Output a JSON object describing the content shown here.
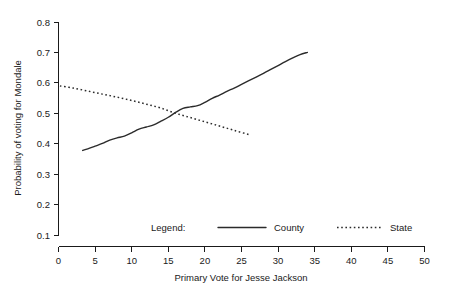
{
  "chart_data": {
    "type": "line",
    "title": "",
    "xlabel": "Primary Vote for Jesse Jackson",
    "ylabel": "Probability of voting for Mondale",
    "xlim": [
      0,
      50
    ],
    "ylim": [
      0.1,
      0.8
    ],
    "xticks": [
      0,
      5,
      10,
      15,
      20,
      25,
      30,
      35,
      40,
      45,
      50
    ],
    "xtick_labels": [
      "0",
      "5",
      "10",
      "15",
      "20",
      "25",
      "30",
      "35",
      "40",
      "45",
      "50"
    ],
    "yticks": [
      0.1,
      0.2,
      0.3,
      0.4,
      0.5,
      0.6,
      0.7,
      0.8
    ],
    "ytick_labels": [
      "0.1",
      "0.2",
      "0.3",
      "0.4",
      "0.5",
      "0.6",
      "0.7",
      "0.8"
    ],
    "grid": false,
    "legend_position": "inside-bottom",
    "legend_title": "Legend:",
    "series": [
      {
        "name": "County",
        "style": "solid",
        "color": "#2b2b2b",
        "points": [
          [
            3.3,
            0.378
          ],
          [
            4.0,
            0.383
          ],
          [
            5.0,
            0.392
          ],
          [
            6.0,
            0.401
          ],
          [
            7.0,
            0.412
          ],
          [
            8.0,
            0.419
          ],
          [
            9.0,
            0.425
          ],
          [
            10.0,
            0.436
          ],
          [
            11.0,
            0.448
          ],
          [
            12.0,
            0.455
          ],
          [
            13.0,
            0.462
          ],
          [
            14.0,
            0.474
          ],
          [
            15.0,
            0.487
          ],
          [
            16.0,
            0.503
          ],
          [
            17.0,
            0.516
          ],
          [
            18.0,
            0.521
          ],
          [
            19.0,
            0.525
          ],
          [
            20.0,
            0.536
          ],
          [
            21.0,
            0.549
          ],
          [
            22.0,
            0.56
          ],
          [
            23.0,
            0.572
          ],
          [
            24.0,
            0.583
          ],
          [
            25.0,
            0.595
          ],
          [
            26.0,
            0.607
          ],
          [
            27.0,
            0.619
          ],
          [
            28.0,
            0.631
          ],
          [
            29.0,
            0.644
          ],
          [
            30.0,
            0.657
          ],
          [
            31.0,
            0.67
          ],
          [
            32.0,
            0.682
          ],
          [
            33.0,
            0.693
          ],
          [
            34.0,
            0.7
          ]
        ]
      },
      {
        "name": "State",
        "style": "dotted",
        "color": "#2b2b2b",
        "points": [
          [
            0.2,
            0.59
          ],
          [
            2.0,
            0.583
          ],
          [
            4.0,
            0.573
          ],
          [
            6.0,
            0.563
          ],
          [
            8.0,
            0.553
          ],
          [
            10.0,
            0.542
          ],
          [
            12.0,
            0.53
          ],
          [
            14.0,
            0.517
          ],
          [
            16.0,
            0.5
          ],
          [
            18.0,
            0.486
          ],
          [
            20.0,
            0.472
          ],
          [
            22.0,
            0.458
          ],
          [
            24.0,
            0.444
          ],
          [
            26.0,
            0.43
          ]
        ]
      }
    ],
    "annotations": {
      "crossing_point": [
        15.6,
        0.5
      ]
    }
  },
  "legend": {
    "title": "Legend:",
    "entries": [
      {
        "label": "County",
        "style": "solid"
      },
      {
        "label": "State",
        "style": "dotted"
      }
    ]
  }
}
